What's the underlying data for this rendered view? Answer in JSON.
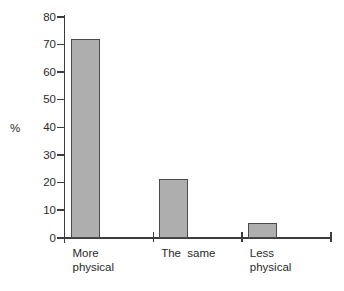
{
  "chart_data": {
    "type": "bar",
    "categories": [
      "More\nphysical",
      "The  same",
      "Less\nphysical"
    ],
    "category_names": [
      "more-physical",
      "the-same",
      "less-physical"
    ],
    "values": [
      72,
      21.5,
      5.5
    ],
    "ylabel": "%",
    "xlabel": "",
    "ylim": [
      0,
      80
    ],
    "yticks": [
      0,
      10,
      20,
      30,
      40,
      50,
      60,
      70,
      80
    ],
    "grid": false,
    "legend": null,
    "colors": {
      "bar_fill": "#aeaeae",
      "bar_border": "#4a4a4a",
      "axis": "#3c3c3c",
      "text": "#2a2a2a",
      "background": "#ffffff"
    }
  }
}
